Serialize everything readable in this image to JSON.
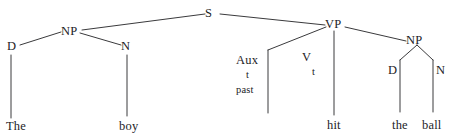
{
  "figure": {
    "type": "syntax-tree",
    "sentence": "The boy hit the ball",
    "background_color": "#ffffff",
    "ink_color": "#1d1d1f",
    "line_color": "#3a3a3c"
  },
  "nodes": {
    "s": "S",
    "np_subject": "NP",
    "det_subject": "D",
    "noun_subject": "N",
    "vp": "VP",
    "aux": "Aux",
    "aux_feature_t": "t",
    "aux_feature_past": "past",
    "verb": "V",
    "verb_feature_t": "t",
    "np_object": "NP",
    "det_object": "D",
    "noun_object": "N"
  },
  "terminals": {
    "the_subject": "The",
    "boy": "boy",
    "hit": "hit",
    "the_object": "the",
    "ball": "ball"
  }
}
